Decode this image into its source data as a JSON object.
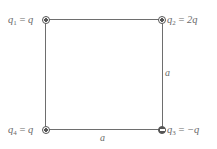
{
  "diagram": {
    "type": "square-charge-configuration",
    "charges": [
      {
        "id": "q1",
        "name": "q",
        "subscript": "1",
        "equals": " = ",
        "value": "q",
        "sign": "positive",
        "corner": "top-left"
      },
      {
        "id": "q2",
        "name": "q",
        "subscript": "2",
        "equals": " = ",
        "value": "2q",
        "sign": "positive",
        "corner": "top-right"
      },
      {
        "id": "q3",
        "name": "q",
        "subscript": "3",
        "equals": " = ",
        "value": "−q",
        "sign": "negative",
        "corner": "bottom-right"
      },
      {
        "id": "q4",
        "name": "q",
        "subscript": "4",
        "equals": " = ",
        "value": "q",
        "sign": "positive",
        "corner": "bottom-left"
      }
    ],
    "side_labels": {
      "right": "a",
      "bottom": "a"
    },
    "colors": {
      "line": "#6e6e6e",
      "charge": "#555555",
      "text": "#6a6a6a",
      "background": "#ffffff"
    }
  }
}
